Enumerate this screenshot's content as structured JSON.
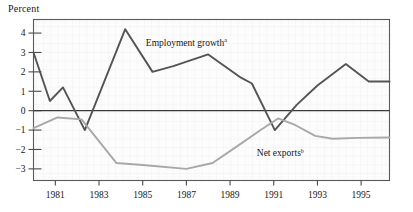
{
  "chart_data": {
    "type": "line",
    "title": "Percent",
    "xlabel": "",
    "ylabel": "Percent",
    "ylim": [
      -3.6,
      4.7
    ],
    "xlim": [
      1980.0,
      1996.3
    ],
    "grid": true,
    "legend": "inline-annotations",
    "yticks": [
      4,
      3,
      2,
      1,
      0,
      -1,
      -2,
      -3
    ],
    "ytick_labels": [
      "4",
      "3",
      "2",
      "1",
      "0",
      "−1",
      "−2",
      "−3"
    ],
    "xticks": [
      1981,
      1983,
      1985,
      1987,
      1989,
      1991,
      1993,
      1995
    ],
    "xtick_labels": [
      "1981",
      "1983",
      "1985",
      "1987",
      "1989",
      "1991",
      "1993",
      "1995"
    ],
    "zero_line": 0,
    "series": [
      {
        "name": "Employment growth",
        "footnote": "a",
        "color": "#545454",
        "label_x": 1987.0,
        "label_y": 3.35,
        "x": [
          1980.0,
          1980.75,
          1981.35,
          1982.35,
          1984.2,
          1985.45,
          1986.4,
          1988.0,
          1989.5,
          1990.0,
          1991.05,
          1992.05,
          1993.0,
          1994.3,
          1995.35,
          1996.3
        ],
        "y": [
          3.0,
          0.5,
          1.2,
          -1.0,
          4.2,
          2.0,
          2.3,
          2.9,
          1.7,
          1.4,
          -1.0,
          0.3,
          1.3,
          2.4,
          1.5,
          1.5
        ]
      },
      {
        "name": "Net exports",
        "footnote": "b",
        "color": "#a8a8a8",
        "label_x": 1991.3,
        "label_y": -2.35,
        "x": [
          1980.0,
          1981.1,
          1982.2,
          1983.8,
          1985.0,
          1987.0,
          1988.2,
          1989.5,
          1990.4,
          1991.2,
          1992.0,
          1992.9,
          1993.7,
          1994.8,
          1996.3
        ],
        "y": [
          -0.9,
          -0.35,
          -0.45,
          -2.7,
          -2.8,
          -3.0,
          -2.7,
          -1.7,
          -1.0,
          -0.4,
          -0.75,
          -1.3,
          -1.45,
          -1.4,
          -1.38
        ]
      }
    ]
  },
  "annotations": {
    "employment_label": "Employment growth",
    "employment_footnote": "a",
    "netexports_label": "Net exports",
    "netexports_footnote": "b"
  }
}
